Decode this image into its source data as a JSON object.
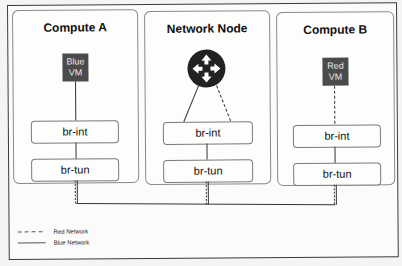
{
  "nodes": [
    {
      "title": "Compute A",
      "vm": {
        "label_line1": "Blue",
        "label_line2": "VM",
        "color": "#4b4b4b"
      },
      "bridges": [
        "br-int",
        "br-tun"
      ]
    },
    {
      "title": "Network Node",
      "router": {
        "icon": "router-icon",
        "color": "#222222"
      },
      "bridges": [
        "br-int",
        "br-tun"
      ]
    },
    {
      "title": "Compute B",
      "vm": {
        "label_line1": "Red",
        "label_line2": "VM",
        "color": "#4b4b4b"
      },
      "bridges": [
        "br-int",
        "br-tun"
      ]
    }
  ],
  "legend": {
    "red": {
      "label": "Red Network",
      "style": "dashed"
    },
    "blue": {
      "label": "Blue Network",
      "style": "solid"
    }
  }
}
